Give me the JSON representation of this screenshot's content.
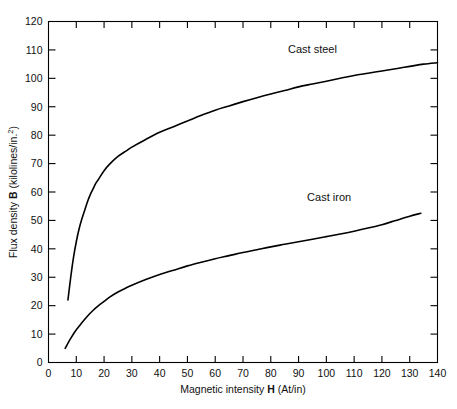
{
  "chart_data": {
    "type": "line",
    "title": "",
    "subtitle": "",
    "xlabel_parts": {
      "pre": "Magnetic intensity ",
      "symbol": "H",
      "post": " (At/in)"
    },
    "ylabel_parts": {
      "pre": "Flux density ",
      "symbol": "B",
      "post": " (kilolines/in.",
      "sup": "2",
      "tail": ")"
    },
    "xlabel": "Magnetic intensity H (At/in)",
    "ylabel": "Flux density B (kilolines/in.2)",
    "xlim": [
      0,
      140
    ],
    "ylim": [
      0,
      120
    ],
    "xticks": [
      0,
      10,
      20,
      30,
      40,
      50,
      60,
      70,
      80,
      90,
      100,
      110,
      120,
      130,
      140
    ],
    "yticks": [
      0,
      10,
      20,
      30,
      40,
      50,
      60,
      70,
      80,
      90,
      100,
      110,
      120
    ],
    "xtick_labels": [
      "0",
      "10",
      "20",
      "30",
      "40",
      "50",
      "60",
      "70",
      "80",
      "90",
      "100",
      "110",
      "120",
      "130",
      "140"
    ],
    "ytick_labels": [
      "0",
      "10",
      "20",
      "30",
      "40",
      "50",
      "60",
      "70",
      "80",
      "90",
      "100",
      "110",
      "120"
    ],
    "grid": false,
    "legend": "inline-annotations",
    "line_color": "#000000",
    "axis_color": "#000000",
    "background": "#ffffff",
    "series": [
      {
        "name": "Cast steel",
        "label_x": 95,
        "label_y": 109,
        "points": [
          [
            7,
            22
          ],
          [
            8,
            30
          ],
          [
            9,
            37
          ],
          [
            10,
            42.5
          ],
          [
            11,
            47
          ],
          [
            12,
            50.5
          ],
          [
            13,
            53.5
          ],
          [
            14,
            56.5
          ],
          [
            15,
            59
          ],
          [
            16,
            61
          ],
          [
            17,
            63
          ],
          [
            18,
            64.5
          ],
          [
            20,
            67.5
          ],
          [
            22,
            69.8
          ],
          [
            25,
            72.5
          ],
          [
            28,
            74.5
          ],
          [
            30,
            75.8
          ],
          [
            35,
            78.5
          ],
          [
            40,
            81
          ],
          [
            45,
            83
          ],
          [
            50,
            85
          ],
          [
            55,
            87
          ],
          [
            60,
            88.8
          ],
          [
            65,
            90.3
          ],
          [
            70,
            91.8
          ],
          [
            75,
            93.2
          ],
          [
            80,
            94.5
          ],
          [
            85,
            95.7
          ],
          [
            90,
            97
          ],
          [
            95,
            98
          ],
          [
            100,
            99
          ],
          [
            105,
            100
          ],
          [
            110,
            101
          ],
          [
            115,
            101.8
          ],
          [
            120,
            102.6
          ],
          [
            125,
            103.4
          ],
          [
            130,
            104.2
          ],
          [
            135,
            105
          ],
          [
            140,
            105.5
          ]
        ]
      },
      {
        "name": "Cast iron",
        "label_x": 101,
        "label_y": 57,
        "points": [
          [
            6,
            5
          ],
          [
            8,
            8.5
          ],
          [
            10,
            11.5
          ],
          [
            12,
            14
          ],
          [
            14,
            16.3
          ],
          [
            16,
            18.3
          ],
          [
            18,
            20
          ],
          [
            20,
            21.5
          ],
          [
            22,
            23
          ],
          [
            25,
            24.8
          ],
          [
            28,
            26.3
          ],
          [
            30,
            27.2
          ],
          [
            35,
            29.2
          ],
          [
            40,
            31
          ],
          [
            45,
            32.5
          ],
          [
            50,
            34
          ],
          [
            55,
            35.3
          ],
          [
            60,
            36.5
          ],
          [
            65,
            37.6
          ],
          [
            70,
            38.7
          ],
          [
            75,
            39.7
          ],
          [
            80,
            40.7
          ],
          [
            85,
            41.6
          ],
          [
            90,
            42.5
          ],
          [
            95,
            43.4
          ],
          [
            100,
            44.3
          ],
          [
            105,
            45.2
          ],
          [
            110,
            46.2
          ],
          [
            115,
            47.3
          ],
          [
            120,
            48.5
          ],
          [
            125,
            50
          ],
          [
            130,
            51.5
          ],
          [
            134,
            52.5
          ]
        ]
      }
    ]
  }
}
